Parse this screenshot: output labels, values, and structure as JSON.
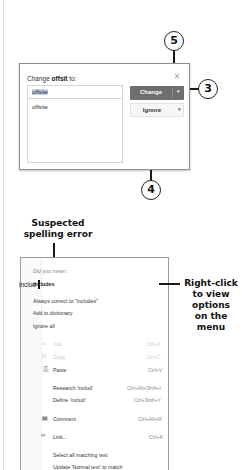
{
  "callouts": {
    "close": "5",
    "change": "3",
    "ignore": "4"
  },
  "dialog": {
    "title_prefix": "Change ",
    "title_word": "offsit",
    "title_suffix": " to:",
    "close_icon": "×",
    "input_value": "offsite",
    "suggestions": [
      "offsite"
    ],
    "change_label": "Change",
    "ignore_label": "Ignore",
    "dropdown_glyph": "▾"
  },
  "annotations": {
    "suspected": "Suspected spelling error",
    "suspected_line1": "Suspected",
    "suspected_line2": "spelling error",
    "right_click_lines": [
      "Right-click",
      "to view",
      "options",
      "on the",
      "menu"
    ]
  },
  "editor": {
    "word": "includ"
  },
  "context_menu": {
    "did_you_mean": "Did you mean:",
    "suggestion": "includes",
    "always_correct": "Always correct to \"includes\"",
    "add_to_dictionary": "Add to dictionary",
    "ignore_all": "Ignore all",
    "cut": {
      "label": "Cut",
      "shortcut": "Ctrl+X"
    },
    "copy": {
      "label": "Copy",
      "shortcut": "Ctrl+C"
    },
    "paste": {
      "label": "Paste",
      "shortcut": "Ctrl+V"
    },
    "research": {
      "label": "Research 'includ'",
      "shortcut": "Ctrl+Alt+Shift+I"
    },
    "define": {
      "label": "Define 'includ'",
      "shortcut": "Ctrl+Shift+Y"
    },
    "comment": {
      "label": "Comment",
      "shortcut": "Ctrl+Alt+M"
    },
    "link": {
      "label": "Link...",
      "shortcut": "Ctrl+K"
    },
    "select_all_matching": "Select all matching text",
    "update_normal": "Update 'Normal text' to match"
  }
}
